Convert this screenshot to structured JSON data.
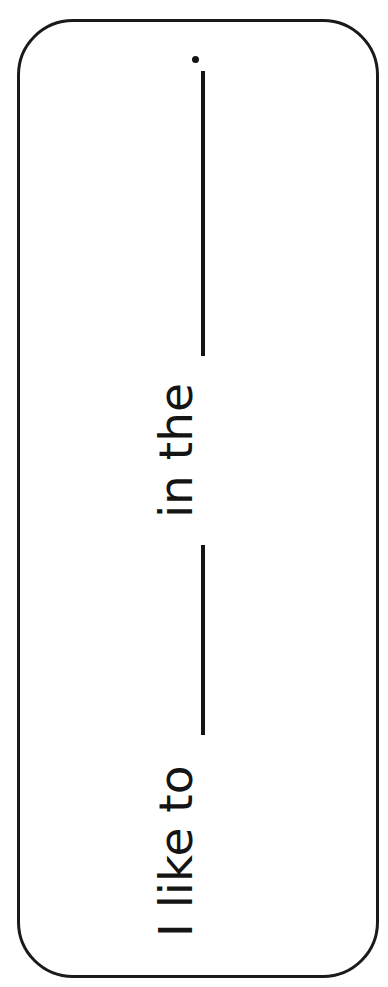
{
  "worksheet": {
    "sentence": {
      "part1": "I like to",
      "part2": "in the",
      "terminal": "."
    },
    "colors": {
      "ink": "#141414",
      "border": "#1a1a1a",
      "background": "#ffffff"
    }
  }
}
